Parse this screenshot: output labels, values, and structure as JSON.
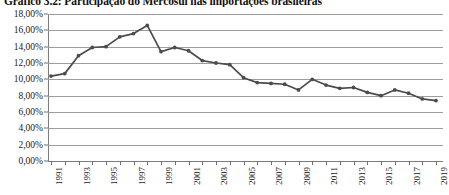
{
  "chart_title": "Gráfico 3.2: Participação do Mercosul nas importações brasileiras",
  "axes": {
    "y_ticks": [
      "0,00%",
      "2,00%",
      "4,00%",
      "6,00%",
      "8,00%",
      "10,00%",
      "12,00%",
      "14,00%",
      "16,00%",
      "18,00%"
    ],
    "x_ticks_visible": [
      "1991",
      "1993",
      "1995",
      "1997",
      "1999",
      "2001",
      "2003",
      "2005",
      "2007",
      "2009",
      "2011",
      "2013",
      "2015",
      "2017",
      "2019"
    ]
  },
  "style": {
    "line_color": "#4b4b4b",
    "grid_color": "#9d9d9d",
    "axis_color": "#7d7d7d",
    "background": "#ffffff"
  },
  "chart_data": {
    "type": "line",
    "title": "Gráfico 3.2: Participação do Mercosul nas importações brasileiras",
    "xlabel": "",
    "ylabel": "",
    "ylim": [
      0,
      18
    ],
    "ytick_step": 2,
    "y_unit": "%",
    "grid": true,
    "legend": false,
    "x": [
      1991,
      1992,
      1993,
      1994,
      1995,
      1996,
      1997,
      1998,
      1999,
      2000,
      2001,
      2002,
      2003,
      2004,
      2005,
      2006,
      2007,
      2008,
      2009,
      2010,
      2011,
      2012,
      2013,
      2014,
      2015,
      2016,
      2017,
      2018,
      2019
    ],
    "values": [
      10.4,
      10.7,
      12.9,
      13.9,
      14.0,
      15.2,
      15.6,
      16.6,
      13.4,
      13.9,
      13.5,
      12.3,
      12.0,
      11.8,
      10.2,
      9.6,
      9.5,
      9.4,
      8.7,
      10.0,
      9.3,
      8.9,
      9.0,
      8.4,
      8.0,
      8.7,
      8.3,
      7.6,
      7.4
    ],
    "series": [
      {
        "name": "Participação do Mercosul",
        "values": [
          10.4,
          10.7,
          12.9,
          13.9,
          14.0,
          15.2,
          15.6,
          16.6,
          13.4,
          13.9,
          13.5,
          12.3,
          12.0,
          11.8,
          10.2,
          9.6,
          9.5,
          9.4,
          8.7,
          10.0,
          9.3,
          8.9,
          9.0,
          8.4,
          8.0,
          8.7,
          8.3,
          7.6,
          7.4
        ]
      }
    ]
  }
}
